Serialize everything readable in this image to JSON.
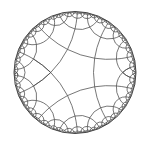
{
  "figure": {
    "type": "poincare-disk-tiling",
    "schlafli": {
      "p": 5,
      "q": 4
    },
    "disk": {
      "cx": 75,
      "cy": 72.5,
      "r": 61
    },
    "central_polygon_vertex_angle_deg": 180,
    "max_depth": 5,
    "min_arc_px": 0.8,
    "colors": {
      "background": "#ffffff",
      "stroke": "#4a4a4a",
      "boundary": "#444444"
    },
    "stroke_width": 0.75,
    "boundary_width": 1
  }
}
